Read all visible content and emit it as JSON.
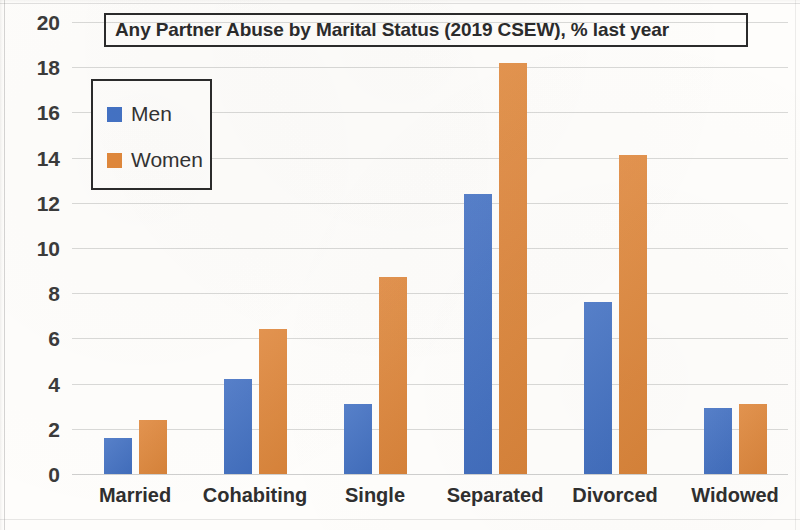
{
  "chart_data": {
    "type": "bar",
    "title": "Any Partner Abuse by Marital Status (2019 CSEW), % last year",
    "xlabel": "",
    "ylabel": "",
    "ylim": [
      0,
      20
    ],
    "ytick_step": 2,
    "yticks": [
      "20",
      "18",
      "16",
      "14",
      "12",
      "10",
      "8",
      "6",
      "4",
      "2",
      "0"
    ],
    "grid": true,
    "legend_position": "upper-left-inside",
    "categories": [
      "Married",
      "Cohabiting",
      "Single",
      "Separated",
      "Divorced",
      "Widowed"
    ],
    "series": [
      {
        "name": "Men",
        "color": "#4472c4",
        "values": [
          1.6,
          4.2,
          3.1,
          12.4,
          7.6,
          2.9
        ]
      },
      {
        "name": "Women",
        "color": "#e0883c",
        "values": [
          2.4,
          6.4,
          8.7,
          18.2,
          14.1,
          3.1
        ]
      }
    ]
  },
  "legend": {
    "entries": [
      {
        "label": "Men",
        "swatch": "men-color-swatch"
      },
      {
        "label": "Women",
        "swatch": "women-color-swatch"
      }
    ]
  },
  "colors": {
    "men": "#4472c4",
    "women": "#e0883c",
    "gridline": "#969696",
    "text": "#3b3b3b",
    "background": "#fefdfb"
  }
}
